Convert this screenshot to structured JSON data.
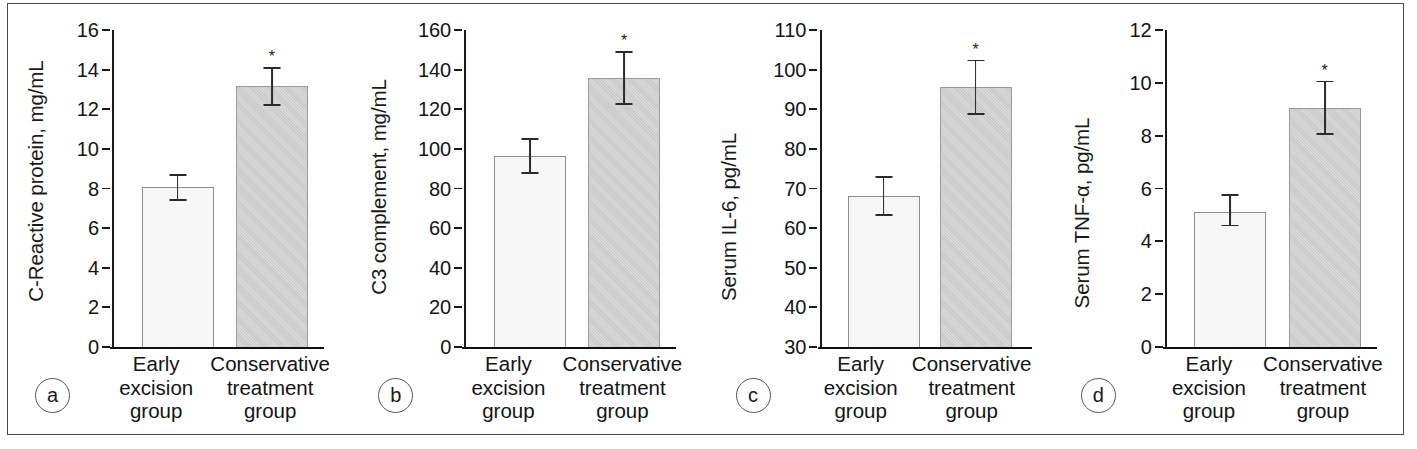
{
  "figure": {
    "border_color": "#4a4a4a",
    "background": "#ffffff",
    "significance_marker": "*",
    "categories": [
      "Early\nexcision\ngroup",
      "Conservative\ntreatment\ngroup"
    ],
    "series_colors": {
      "early_excision": "#f7f7f7",
      "conservative_treatment": "#c9c9c9"
    }
  },
  "chart_data": [
    {
      "type": "bar",
      "panel": "a",
      "panel_label": "a",
      "title": "",
      "xlabel": "",
      "ylabel": "C-Reactive protein, mg/mL",
      "categories": [
        "Early excision group",
        "Conservative treatment group"
      ],
      "category_lines": [
        [
          "Early",
          "excision",
          "group"
        ],
        [
          "Conservative",
          "treatment",
          "group"
        ]
      ],
      "values": [
        8.1,
        13.15
      ],
      "errors_low": [
        7.4,
        12.2
      ],
      "errors_high": [
        8.7,
        14.1
      ],
      "error_minus": [
        0.7,
        0.95
      ],
      "error_plus": [
        0.6,
        0.95
      ],
      "significance": [
        false,
        true
      ],
      "ylim": [
        0,
        16
      ],
      "yticks": [
        0,
        2,
        4,
        6,
        8,
        10,
        12,
        14,
        16
      ],
      "ytick_labels": [
        "0",
        "2",
        "4",
        "6",
        "8",
        "10",
        "12",
        "14",
        "16"
      ],
      "grid": false,
      "legend": "none"
    },
    {
      "type": "bar",
      "panel": "b",
      "panel_label": "b",
      "title": "",
      "xlabel": "",
      "ylabel": "C3 complement, mg/mL",
      "categories": [
        "Early excision group",
        "Conservative treatment group"
      ],
      "category_lines": [
        [
          "Early",
          "excision",
          "group"
        ],
        [
          "Conservative",
          "treatment",
          "group"
        ]
      ],
      "values": [
        96.5,
        136.0
      ],
      "errors_low": [
        88.0,
        122.5
      ],
      "errors_high": [
        105.0,
        149.0
      ],
      "error_minus": [
        8.5,
        13.5
      ],
      "error_plus": [
        8.5,
        13.0
      ],
      "significance": [
        false,
        true
      ],
      "ylim": [
        0,
        160
      ],
      "yticks": [
        0,
        20,
        40,
        60,
        80,
        100,
        120,
        140,
        160
      ],
      "ytick_labels": [
        "0",
        "20",
        "40",
        "60",
        "80",
        "100",
        "120",
        "140",
        "160"
      ],
      "grid": false,
      "legend": "none"
    },
    {
      "type": "bar",
      "panel": "c",
      "panel_label": "c",
      "title": "",
      "xlabel": "",
      "ylabel": "Serum IL-6, pg/mL",
      "categories": [
        "Early excision group",
        "Conservative treatment group"
      ],
      "category_lines": [
        [
          "Early",
          "excision",
          "group"
        ],
        [
          "Conservative",
          "treatment",
          "group"
        ]
      ],
      "values": [
        68.0,
        95.5
      ],
      "errors_low": [
        63.3,
        88.8
      ],
      "errors_high": [
        72.8,
        102.3
      ],
      "error_minus": [
        4.7,
        6.7
      ],
      "error_plus": [
        4.8,
        6.8
      ],
      "significance": [
        false,
        true
      ],
      "ylim": [
        30,
        110
      ],
      "yticks": [
        30,
        40,
        50,
        60,
        70,
        80,
        90,
        100,
        110
      ],
      "ytick_labels": [
        "30",
        "40",
        "50",
        "60",
        "70",
        "80",
        "90",
        "100",
        "110"
      ],
      "grid": false,
      "legend": "none"
    },
    {
      "type": "bar",
      "panel": "d",
      "panel_label": "d",
      "title": "",
      "xlabel": "",
      "ylabel": "Serum TNF-α, pg/mL",
      "categories": [
        "Early excision group",
        "Conservative treatment group"
      ],
      "category_lines": [
        [
          "Early",
          "excision",
          "group"
        ],
        [
          "Conservative",
          "treatment",
          "group"
        ]
      ],
      "values": [
        5.1,
        9.05
      ],
      "errors_low": [
        4.6,
        8.05
      ],
      "errors_high": [
        5.75,
        10.05
      ],
      "error_minus": [
        0.5,
        1.0
      ],
      "error_plus": [
        0.65,
        1.0
      ],
      "significance": [
        false,
        true
      ],
      "ylim": [
        0,
        12
      ],
      "yticks": [
        0,
        2,
        4,
        6,
        8,
        10,
        12
      ],
      "ytick_labels": [
        "0",
        "2",
        "4",
        "6",
        "8",
        "10",
        "12"
      ],
      "grid": false,
      "legend": "none"
    }
  ]
}
